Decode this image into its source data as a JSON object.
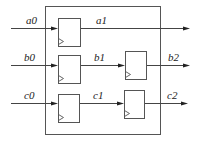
{
  "diagram": {
    "type": "pipeline-register-diagram",
    "container": {
      "x": 45,
      "y": 6,
      "w": 115,
      "h": 128
    },
    "flip_flops": [
      {
        "id": "ff_a1",
        "x": 58,
        "y": 18,
        "w": 22,
        "h": 28
      },
      {
        "id": "ff_b1",
        "x": 58,
        "y": 55,
        "w": 22,
        "h": 28
      },
      {
        "id": "ff_c1",
        "x": 58,
        "y": 94,
        "w": 21,
        "h": 28
      },
      {
        "id": "ff_b2",
        "x": 125,
        "y": 51,
        "w": 21,
        "h": 28
      },
      {
        "id": "ff_c2",
        "x": 124,
        "y": 90,
        "w": 20,
        "h": 28
      }
    ],
    "signals": [
      {
        "name": "a0",
        "label": "a0",
        "lx": 26,
        "ly": 24
      },
      {
        "name": "a1",
        "label": "a1",
        "lx": 96,
        "ly": 24
      },
      {
        "name": "b0",
        "label": "b0",
        "lx": 24,
        "ly": 61
      },
      {
        "name": "b1",
        "label": "b1",
        "lx": 94,
        "ly": 61
      },
      {
        "name": "b2",
        "label": "b2",
        "lx": 168,
        "ly": 61
      },
      {
        "name": "c0",
        "label": "c0",
        "lx": 24,
        "ly": 99
      },
      {
        "name": "c1",
        "label": "c1",
        "lx": 93,
        "ly": 99
      },
      {
        "name": "c2",
        "label": "c2",
        "lx": 167,
        "ly": 99
      }
    ],
    "wires": [
      {
        "from": "a0",
        "x1": 11,
        "x2": 58,
        "y": 28
      },
      {
        "from": "a1",
        "x1": 80,
        "x2": 190,
        "y": 28
      },
      {
        "from": "b0",
        "x1": 11,
        "x2": 58,
        "y": 65
      },
      {
        "from": "b1",
        "x1": 80,
        "x2": 125,
        "y": 65
      },
      {
        "from": "b2",
        "x1": 146,
        "x2": 190,
        "y": 65
      },
      {
        "from": "c0",
        "x1": 11,
        "x2": 58,
        "y": 103
      },
      {
        "from": "c1",
        "x1": 79,
        "x2": 124,
        "y": 103
      },
      {
        "from": "c2",
        "x1": 144,
        "x2": 188,
        "y": 103
      }
    ]
  }
}
